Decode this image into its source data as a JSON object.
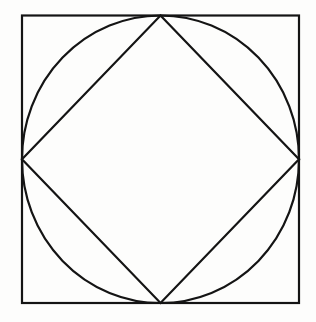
{
  "figure": {
    "background_color": "#fdfdfc",
    "stroke_color": "#141414",
    "canvas": {
      "width": 316,
      "height": 322
    },
    "shapes": {
      "outer_square": {
        "name": "outer-square",
        "type": "rect",
        "x": 22,
        "y": 15.5,
        "width": 277,
        "height": 287.5,
        "stroke_width": 2.2,
        "fill": "none"
      },
      "inscribed_circle": {
        "name": "inscribed-circle",
        "type": "ellipse",
        "cx": 160.5,
        "cy": 159.25,
        "rx": 138.5,
        "ry": 143.75,
        "stroke_width": 2.2,
        "fill": "none",
        "tangency": "tangent to all four sides of the outer square"
      },
      "inner_diamond": {
        "name": "inner-diamond",
        "type": "polygon",
        "points": "160.5,15.5 299,159.25 160.5,303 22,159.25",
        "vertices": [
          {
            "label": "top",
            "x": 160.5,
            "y": 15.5
          },
          {
            "label": "right",
            "x": 299,
            "y": 159.25
          },
          {
            "label": "bottom",
            "x": 160.5,
            "y": 303
          },
          {
            "label": "left",
            "x": 22,
            "y": 159.25
          }
        ],
        "stroke_width": 2.2,
        "fill": "none",
        "tangency": "vertices meet the circle's tangent points on the square's midpoints"
      }
    }
  }
}
